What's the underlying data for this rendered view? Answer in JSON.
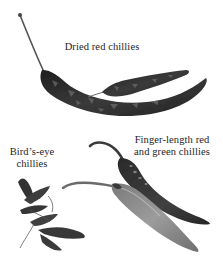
{
  "illustration": {
    "style": "grayscale photo illustration",
    "colors": {
      "background": "#ffffff",
      "dried_chilli": "#2b2b2b",
      "dried_chilli_highlight": "#6e6e6e",
      "red_chilli": "#3a3a3a",
      "green_chilli": "#8a8a8a",
      "birds_eye_chilli": "#3c3c3c",
      "label_text": "#1e1e1e"
    },
    "groups": [
      {
        "id": "dried",
        "label_lines": [
          "Dried red chillies"
        ],
        "items": [
          "dried-chilli-large",
          "dried-chilli-small"
        ]
      },
      {
        "id": "finger",
        "label_lines": [
          "Finger-length red",
          "and green chillies"
        ],
        "items": [
          "red-finger-chilli",
          "green-finger-chilli"
        ]
      },
      {
        "id": "birds-eye",
        "label_lines": [
          "Bird’s-eye",
          "chillies"
        ],
        "items": [
          "birds-eye-cluster"
        ]
      }
    ]
  }
}
